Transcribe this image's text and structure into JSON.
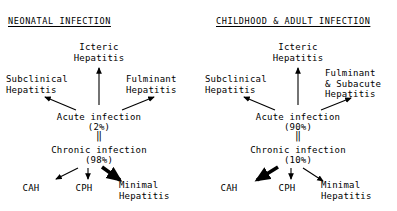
{
  "figure": {
    "background_color": "#ffffff",
    "text_color": "#000000"
  },
  "panels": [
    {
      "id": "neonatal",
      "title": "NEONATAL INFECTION",
      "nodes": {
        "icteric": "Icteric\nHepatitis",
        "subclinical": "Subclinical\nHepatitis",
        "fulminant": "Fulminant\nHepatitis",
        "acute": "Acute infection",
        "acute_pct": "(2%)",
        "equals": "‖",
        "chronic": "Chronic infection",
        "chronic_pct": "(98%)",
        "cah": "CAH",
        "cph": "CPH",
        "minimal": "Minimal\nHepatitis"
      },
      "emphasis_outcome": "minimal"
    },
    {
      "id": "childhood-adult",
      "title": "CHILDHOOD & ADULT INFECTION",
      "nodes": {
        "icteric": "Icteric\nHepatitis",
        "subclinical": "Subclinical\nHepatitis",
        "fulminant": "Fulminant\n& Subacute\nHepatitis",
        "acute": "Acute infection",
        "acute_pct": "(90%)",
        "equals": "‖",
        "chronic": "Chronic infection",
        "chronic_pct": "(10%)",
        "cah": "CAH",
        "cph": "CPH",
        "minimal": "Minimal\nHepatitis"
      },
      "emphasis_outcome": "cah"
    }
  ]
}
